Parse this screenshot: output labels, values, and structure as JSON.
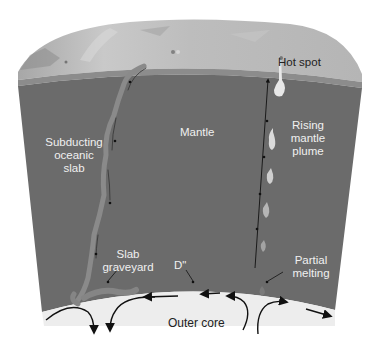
{
  "diagram": {
    "type": "earth-interior-cross-section",
    "labels": {
      "hot_spot": "Hot spot",
      "mantle": "Mantle",
      "subducting_1": "Subducting",
      "subducting_2": "oceanic",
      "subducting_3": "slab",
      "rising_1": "Rising",
      "rising_2": "mantle",
      "rising_3": "plume",
      "slab_graveyard_1": "Slab",
      "slab_graveyard_2": "graveyard",
      "d_double_prime": "D\"",
      "partial_melting_1": "Partial",
      "partial_melting_2": "melting",
      "outer_core": "Outer core"
    },
    "colors": {
      "surface": "#b9b9b9",
      "crust": "#8c8c8c",
      "mantle": "#6b6b6b",
      "outer_core": "#eeeeee",
      "slab": "#8a8a8a",
      "plume": "#e6e6e6",
      "arrow": "#111111"
    }
  }
}
